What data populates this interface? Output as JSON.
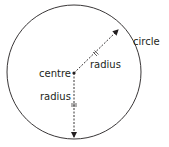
{
  "diagram": {
    "labels": {
      "circle": "circle",
      "centre": "centre",
      "radius_diagonal": "radius",
      "radius_vertical": "radius"
    },
    "colors": {
      "stroke": "#231f20",
      "background": "#ffffff"
    }
  }
}
